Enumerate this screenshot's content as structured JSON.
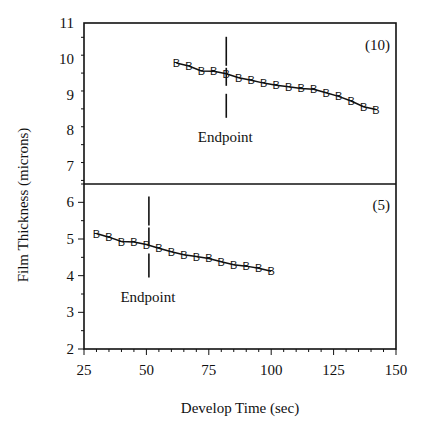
{
  "chart_data": {
    "type": "line",
    "xlabel": "Develop Time (sec)",
    "ylabel": "Film Thickness (microns)",
    "xlim": [
      25,
      150
    ],
    "x_ticks": [
      "25",
      "50",
      "75",
      "100",
      "125",
      "150"
    ],
    "grid": false,
    "legend": null,
    "marker": "B",
    "panels": [
      {
        "label": "(10)",
        "ylim": [
          6.5,
          11
        ],
        "y_ticks": [
          "7",
          "8",
          "9",
          "10",
          "11"
        ],
        "endpoint": {
          "x": 82,
          "label": "Endpoint"
        },
        "series": [
          {
            "name": "(10)",
            "x": [
              62,
              67,
              72,
              77,
              82,
              87,
              92,
              97,
              102,
              107,
              112,
              117,
              122,
              127,
              132,
              137,
              142
            ],
            "values": [
              9.88,
              9.8,
              9.66,
              9.65,
              9.58,
              9.47,
              9.4,
              9.32,
              9.26,
              9.22,
              9.17,
              9.15,
              9.05,
              8.95,
              8.82,
              8.66,
              8.58
            ]
          }
        ]
      },
      {
        "label": "(5)",
        "ylim": [
          2,
          6.5
        ],
        "y_ticks": [
          "2",
          "3",
          "4",
          "5",
          "6"
        ],
        "endpoint": {
          "x": 51,
          "label": "Endpoint"
        },
        "series": [
          {
            "name": "(5)",
            "x": [
              30,
              35,
              40,
              45,
              50,
              55,
              60,
              65,
              70,
              75,
              80,
              85,
              90,
              95,
              100
            ],
            "values": [
              5.15,
              5.05,
              4.93,
              4.92,
              4.85,
              4.75,
              4.65,
              4.57,
              4.52,
              4.47,
              4.38,
              4.3,
              4.26,
              4.2,
              4.12
            ]
          }
        ]
      }
    ]
  }
}
